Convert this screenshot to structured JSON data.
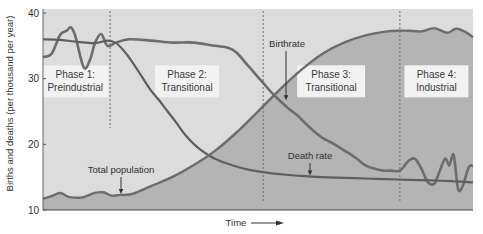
{
  "chart_data": {
    "type": "line",
    "title": "",
    "xlabel": "Time",
    "ylabel": "Births and deaths (per thousand per year)",
    "xlim": [
      0,
      100
    ],
    "ylim": [
      10,
      40
    ],
    "yticks": [
      10,
      20,
      30,
      40
    ],
    "grid": false,
    "legend": "none",
    "phase_boundaries": [
      15.6,
      51.2,
      83.0
    ],
    "phases": [
      {
        "line1": "Phase 1:",
        "line2": "Preindustrial",
        "x_center": 7.5,
        "y_center": 29.6
      },
      {
        "line1": "Phase 2:",
        "line2": "Transitional",
        "x_center": 33.5,
        "y_center": 29.6
      },
      {
        "line1": "Phase 3:",
        "line2": "Transitional",
        "x_center": 67,
        "y_center": 29.6
      },
      {
        "line1": "Phase 4:",
        "line2": "Industrial",
        "x_center": 91.5,
        "y_center": 29.6
      }
    ],
    "series": [
      {
        "name": "Birthrate",
        "x": [
          0,
          2,
          4,
          5.5,
          6.5,
          7.5,
          9.5,
          11,
          12,
          13.5,
          15,
          17,
          20,
          25,
          30,
          35,
          40,
          43,
          45,
          47,
          49,
          51,
          53,
          55,
          57,
          59,
          61,
          63,
          65,
          67,
          69,
          71,
          73,
          75,
          77,
          79,
          81,
          83,
          85,
          86.5,
          88,
          89.5,
          91,
          92,
          93.5,
          94.5,
          95.5,
          96.5,
          97.5,
          99,
          100
        ],
        "values": [
          33.3,
          33.8,
          36.7,
          37.3,
          37.8,
          36.5,
          31.7,
          33.0,
          35.3,
          36.8,
          35.0,
          35.5,
          36.0,
          35.8,
          35.5,
          35.5,
          35.0,
          34.7,
          34.0,
          32.5,
          31.0,
          29.5,
          28.0,
          26.7,
          25.5,
          24.5,
          23.2,
          22.0,
          21.0,
          20.3,
          19.5,
          18.7,
          17.8,
          16.8,
          16.3,
          16.0,
          16.0,
          16.0,
          17.5,
          17.8,
          16.3,
          14.2,
          14.0,
          15.5,
          17.8,
          16.8,
          18.4,
          13.3,
          13.5,
          16.5,
          16.7
        ]
      },
      {
        "name": "Death rate",
        "x": [
          0,
          4,
          8,
          12,
          15,
          17,
          19,
          21,
          23,
          25,
          27,
          29,
          31,
          33,
          35,
          37,
          40,
          44,
          48,
          52,
          56,
          60,
          65,
          70,
          75,
          80,
          85,
          90,
          95,
          100
        ],
        "values": [
          36.0,
          35.9,
          35.6,
          35.4,
          35.8,
          35.4,
          34.1,
          32.3,
          30.3,
          28.3,
          26.7,
          25.0,
          23.3,
          21.5,
          20.1,
          19.0,
          17.8,
          16.8,
          16.1,
          15.7,
          15.4,
          15.2,
          15.0,
          14.9,
          14.8,
          14.7,
          14.6,
          14.5,
          14.4,
          14.2
        ]
      },
      {
        "name": "Total population",
        "x": [
          0,
          2,
          4,
          6,
          9,
          12,
          14,
          16,
          18,
          19,
          21,
          25,
          30,
          35,
          40,
          45,
          50,
          55,
          60,
          65,
          70,
          75,
          80,
          83,
          85,
          88,
          91,
          94,
          96,
          98,
          100
        ],
        "values": [
          11.7,
          12.1,
          12.6,
          12.0,
          11.9,
          12.6,
          12.7,
          12.2,
          12.3,
          12.3,
          12.5,
          13.6,
          15.0,
          16.8,
          19.0,
          21.8,
          25.0,
          28.3,
          31.3,
          33.8,
          35.5,
          36.6,
          37.2,
          37.3,
          37.3,
          37.2,
          37.7,
          37.0,
          37.6,
          37.2,
          36.3
        ]
      }
    ],
    "annotations": [
      {
        "text": "Birthrate",
        "target_series": "Birthrate"
      },
      {
        "text": "Death rate",
        "target_series": "Death rate"
      },
      {
        "text": "Total population",
        "target_series": "Total population"
      }
    ]
  },
  "colors": {
    "plot_background": "#dcdcdc",
    "population_fill": "#b4b4b4",
    "line": "#6c6c6c",
    "death_line": "#5e5e5e",
    "label_box": "#f2f2f2",
    "divider": "#707070"
  }
}
